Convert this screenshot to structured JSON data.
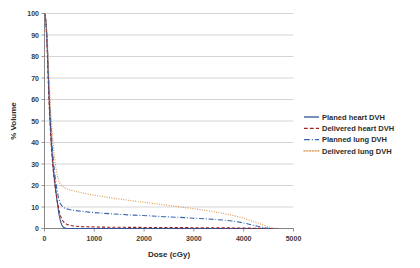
{
  "chart_data": {
    "type": "line",
    "title": "",
    "xlabel": "Dose (cGy)",
    "ylabel": "% Volume",
    "xlim": [
      0,
      5000
    ],
    "ylim": [
      0,
      100
    ],
    "xticks": [
      0,
      1000,
      2000,
      3000,
      4000,
      5000
    ],
    "xtick_labels": [
      "0",
      "1000",
      "2000",
      "3000",
      "4000",
      "5000"
    ],
    "yticks": [
      0,
      10,
      20,
      30,
      40,
      50,
      60,
      70,
      80,
      90,
      100
    ],
    "ytick_labels": [
      "0",
      "10",
      "20",
      "30",
      "40",
      "50",
      "60",
      "70",
      "80",
      "90",
      "100"
    ],
    "grid": "horizontal",
    "legend_position": "right",
    "series": [
      {
        "name": "Planed heart DVH",
        "color": "#2f5597",
        "style": "solid",
        "points": [
          [
            0,
            100
          ],
          [
            15,
            99
          ],
          [
            30,
            96
          ],
          [
            45,
            90
          ],
          [
            60,
            82
          ],
          [
            75,
            72
          ],
          [
            90,
            62
          ],
          [
            105,
            54
          ],
          [
            120,
            47
          ],
          [
            135,
            41
          ],
          [
            150,
            36
          ],
          [
            165,
            31
          ],
          [
            180,
            27
          ],
          [
            195,
            24
          ],
          [
            210,
            21
          ],
          [
            225,
            18
          ],
          [
            240,
            15
          ],
          [
            255,
            12.5
          ],
          [
            270,
            10
          ],
          [
            285,
            7.5
          ],
          [
            300,
            5.5
          ],
          [
            315,
            4
          ],
          [
            330,
            2.8
          ],
          [
            345,
            1.8
          ],
          [
            360,
            1.1
          ],
          [
            380,
            0.6
          ],
          [
            400,
            0.3
          ],
          [
            430,
            0.1
          ],
          [
            470,
            0.0
          ],
          [
            600,
            0.0
          ],
          [
            1000,
            0.0
          ],
          [
            2000,
            0.0
          ],
          [
            3000,
            0.0
          ],
          [
            4000,
            0.0
          ],
          [
            4600,
            0.0
          ]
        ]
      },
      {
        "name": "Delivered heart DVH",
        "color": "#a02020",
        "style": "dashed",
        "points": [
          [
            0,
            100
          ],
          [
            15,
            99
          ],
          [
            30,
            95
          ],
          [
            45,
            88
          ],
          [
            60,
            79
          ],
          [
            75,
            69
          ],
          [
            90,
            60
          ],
          [
            105,
            52
          ],
          [
            120,
            45
          ],
          [
            135,
            39
          ],
          [
            150,
            34
          ],
          [
            165,
            30
          ],
          [
            180,
            26
          ],
          [
            195,
            23
          ],
          [
            210,
            20
          ],
          [
            225,
            17.5
          ],
          [
            240,
            15
          ],
          [
            255,
            13
          ],
          [
            270,
            11
          ],
          [
            285,
            9.2
          ],
          [
            300,
            7.6
          ],
          [
            320,
            6.0
          ],
          [
            340,
            4.8
          ],
          [
            360,
            3.8
          ],
          [
            390,
            2.9
          ],
          [
            420,
            2.3
          ],
          [
            460,
            1.8
          ],
          [
            520,
            1.4
          ],
          [
            600,
            1.1
          ],
          [
            700,
            0.9
          ],
          [
            850,
            0.8
          ],
          [
            1000,
            0.7
          ],
          [
            1300,
            0.6
          ],
          [
            1600,
            0.55
          ],
          [
            2000,
            0.5
          ],
          [
            2400,
            0.45
          ],
          [
            2800,
            0.4
          ],
          [
            3200,
            0.35
          ],
          [
            3600,
            0.3
          ],
          [
            4000,
            0.2
          ],
          [
            4300,
            0.1
          ],
          [
            4500,
            0.0
          ],
          [
            4650,
            0.0
          ]
        ]
      },
      {
        "name": "Planned lung DVH",
        "color": "#3366aa",
        "style": "dashdot",
        "points": [
          [
            0,
            100
          ],
          [
            15,
            99
          ],
          [
            30,
            96
          ],
          [
            45,
            91
          ],
          [
            60,
            84
          ],
          [
            75,
            75
          ],
          [
            90,
            66
          ],
          [
            105,
            58
          ],
          [
            120,
            51
          ],
          [
            135,
            45
          ],
          [
            150,
            40
          ],
          [
            165,
            35
          ],
          [
            180,
            31
          ],
          [
            195,
            27.5
          ],
          [
            210,
            24.5
          ],
          [
            225,
            22
          ],
          [
            240,
            19.5
          ],
          [
            255,
            17.5
          ],
          [
            270,
            15.5
          ],
          [
            290,
            13.5
          ],
          [
            310,
            12
          ],
          [
            340,
            10.8
          ],
          [
            380,
            9.8
          ],
          [
            430,
            9.2
          ],
          [
            500,
            8.8
          ],
          [
            600,
            8.4
          ],
          [
            750,
            8.0
          ],
          [
            900,
            7.6
          ],
          [
            1100,
            7.2
          ],
          [
            1300,
            6.9
          ],
          [
            1500,
            6.6
          ],
          [
            1800,
            6.2
          ],
          [
            2100,
            5.9
          ],
          [
            2400,
            5.5
          ],
          [
            2700,
            5.2
          ],
          [
            3000,
            4.8
          ],
          [
            3300,
            4.4
          ],
          [
            3600,
            3.9
          ],
          [
            3800,
            3.4
          ],
          [
            4000,
            2.6
          ],
          [
            4150,
            1.7
          ],
          [
            4300,
            0.9
          ],
          [
            4420,
            0.3
          ],
          [
            4520,
            0.0
          ],
          [
            4700,
            0.0
          ]
        ]
      },
      {
        "name": "Delivered lung DVH",
        "color": "#d98a36",
        "style": "dotted",
        "points": [
          [
            0,
            100
          ],
          [
            15,
            99
          ],
          [
            30,
            97
          ],
          [
            45,
            93
          ],
          [
            60,
            87
          ],
          [
            75,
            79
          ],
          [
            90,
            71
          ],
          [
            105,
            64
          ],
          [
            120,
            57
          ],
          [
            135,
            51
          ],
          [
            150,
            46
          ],
          [
            165,
            42
          ],
          [
            180,
            38
          ],
          [
            195,
            34.5
          ],
          [
            210,
            31.5
          ],
          [
            225,
            29
          ],
          [
            240,
            27
          ],
          [
            255,
            25
          ],
          [
            270,
            23.5
          ],
          [
            290,
            22
          ],
          [
            310,
            21
          ],
          [
            340,
            20
          ],
          [
            380,
            19.2
          ],
          [
            430,
            18.6
          ],
          [
            500,
            18.0
          ],
          [
            600,
            17.4
          ],
          [
            750,
            16.6
          ],
          [
            900,
            15.9
          ],
          [
            1100,
            15.1
          ],
          [
            1300,
            14.4
          ],
          [
            1500,
            13.7
          ],
          [
            1800,
            12.8
          ],
          [
            2100,
            11.9
          ],
          [
            2400,
            11.0
          ],
          [
            2700,
            10.1
          ],
          [
            3000,
            9.2
          ],
          [
            3300,
            8.2
          ],
          [
            3600,
            7.0
          ],
          [
            3800,
            6.0
          ],
          [
            4000,
            4.8
          ],
          [
            4150,
            3.6
          ],
          [
            4300,
            2.4
          ],
          [
            4420,
            1.4
          ],
          [
            4520,
            0.6
          ],
          [
            4620,
            0.1
          ],
          [
            4700,
            0.0
          ]
        ]
      }
    ]
  },
  "legend": {
    "items": [
      {
        "label": "Planed heart DVH",
        "color": "#2f5597",
        "style": "solid"
      },
      {
        "label": "Delivered heart DVH",
        "color": "#a02020",
        "style": "dashed"
      },
      {
        "label": "Planned lung DVH",
        "color": "#3366aa",
        "style": "dashdot"
      },
      {
        "label": "Delivered lung DVH",
        "color": "#d98a36",
        "style": "dotted"
      }
    ]
  }
}
